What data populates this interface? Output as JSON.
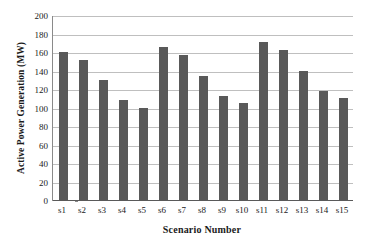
{
  "chart_data": {
    "type": "bar",
    "title": "",
    "xlabel": "Scenario Number",
    "ylabel": "Active Power Generation (MW)",
    "categories": [
      "s1",
      "s2",
      "s3",
      "s4",
      "s5",
      "s6",
      "s7",
      "s8",
      "s9",
      "s10",
      "s11",
      "s12",
      "s13",
      "s14",
      "s15"
    ],
    "values": [
      161,
      152,
      131,
      109,
      101,
      166,
      158,
      135,
      114,
      106,
      172,
      163,
      141,
      119,
      111
    ],
    "series": [
      {
        "name": "Active Power Generation",
        "values": [
          161,
          152,
          131,
          109,
          101,
          166,
          158,
          135,
          114,
          106,
          172,
          163,
          141,
          119,
          111
        ]
      }
    ],
    "ylim": [
      0,
      200
    ],
    "ytick_step": 20,
    "yticks": [
      0,
      20,
      40,
      60,
      80,
      100,
      120,
      140,
      160,
      180,
      200
    ],
    "ytick_labels": [
      "0",
      "20",
      "40",
      "60",
      "80",
      "100",
      "120",
      "140",
      "160",
      "180",
      "200"
    ],
    "grid": "horizontal",
    "legend": "none",
    "bar_color": "#595959",
    "gridline_color": "#bfbfbf",
    "axis_color": "#8a8a8a",
    "background_color": "#ffffff"
  }
}
